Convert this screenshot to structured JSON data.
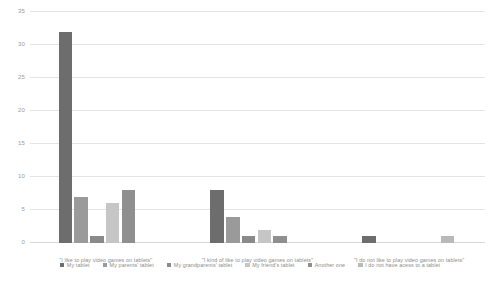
{
  "chart_data": {
    "type": "bar",
    "title": "",
    "subtitle": "",
    "xlabel": "",
    "ylabel": "",
    "grid": true,
    "legend_position": "bottom",
    "ylim": [
      0,
      35
    ],
    "yticks": [
      "0",
      "5",
      "10",
      "15",
      "20",
      "25",
      "30",
      "35"
    ],
    "ytick_values": [
      0,
      5,
      10,
      15,
      20,
      25,
      30,
      35
    ],
    "categories": [
      "\"I like to play video games on tablets\"",
      "\"I kind of like to play video games on tablets\"",
      "\"I do not like to play video games on tablets\""
    ],
    "series": [
      {
        "name": "My tablet",
        "color": "#6d6d6d",
        "values": [
          32,
          8,
          1
        ]
      },
      {
        "name": "My parents' tablet",
        "color": "#9a9a9a",
        "values": [
          7,
          4,
          0
        ]
      },
      {
        "name": "My grandparents' tablet",
        "color": "#8a8a8a",
        "values": [
          1,
          1,
          0
        ]
      },
      {
        "name": "My friend's tablet",
        "color": "#c6c6c6",
        "values": [
          6,
          2,
          0
        ]
      },
      {
        "name": "Another one",
        "color": "#8f8f8f",
        "values": [
          8,
          1,
          0
        ]
      },
      {
        "name": "I do not have acess to a tablet",
        "color": "#b9b9b9",
        "values": [
          0,
          0,
          1
        ]
      }
    ]
  },
  "colors": {
    "background": "#ffffff",
    "gridline": "#e4e4e4",
    "baseline": "#d8d8d8",
    "axis_text": "#9a9a9a",
    "label_text": "#8d8d8d"
  }
}
